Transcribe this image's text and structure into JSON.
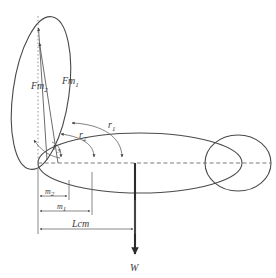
{
  "figure": {
    "background_color": "#ffffff",
    "stroke_color": "#4a4a4a",
    "text_color": "#3a3a3a",
    "accent_color": "#2b2b2b"
  },
  "labels": {
    "force_m2": {
      "base": "Fm",
      "sub": "2"
    },
    "force_m1": {
      "base": "Fm",
      "sub": "1"
    },
    "radius_1": {
      "base": "r",
      "sub": "1"
    },
    "radius_2": {
      "base": "r",
      "sub": "2"
    },
    "radius_3": {
      "base": "r",
      "sub": "3"
    },
    "moment_arm_2": {
      "base": "m",
      "sub": "2"
    },
    "moment_arm_1": {
      "base": "m",
      "sub": "1"
    },
    "center_of_mass": "Lcm",
    "weight": "W"
  },
  "geometry": {
    "pivot": {
      "x": 38,
      "y": 163
    },
    "centerline": {
      "x1": 38,
      "y1": 163,
      "x2": 270,
      "y2": 163
    },
    "vertical_ellipse": {
      "cx": 41,
      "cy": 93,
      "rx": 28,
      "ry": 77,
      "rotation": 8
    },
    "horizontal_ellipse": {
      "cx": 140,
      "cy": 163,
      "rx": 102,
      "ry": 30
    },
    "head_circle": {
      "cx": 238,
      "cy": 163,
      "rx": 33,
      "ry": 28
    },
    "force_arrow_m2": {
      "x1": 46,
      "y1": 158,
      "x2": 38,
      "y2": 27
    },
    "force_arrow_m1": {
      "x1": 56,
      "y1": 162,
      "x2": 39,
      "y2": 42
    },
    "weight_arrow": {
      "x": 135,
      "y1": 163,
      "y2": 256
    },
    "radius_arrow_tips": [
      61,
      94,
      122
    ],
    "dimension_lines": [
      {
        "name": "m2",
        "y": 196,
        "x1": 38,
        "x2": 69
      },
      {
        "name": "m1",
        "y": 211,
        "x1": 38,
        "x2": 92
      },
      {
        "name": "Lcm",
        "y": 229,
        "x1": 38,
        "x2": 135
      }
    ]
  }
}
